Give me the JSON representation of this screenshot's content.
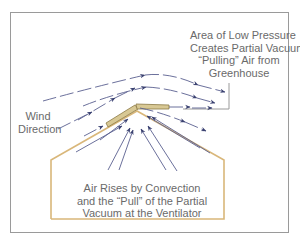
{
  "diagram": {
    "labels": {
      "low_pressure": [
        "Area of Low Pressure",
        "Creates Partial Vacuum;",
        "“Pulling” Air from",
        "Greenhouse"
      ],
      "wind_direction": [
        "Wind",
        "Direction"
      ],
      "convection": [
        "Air Rises by Convection",
        "and the “Pull” of the Partial",
        "Vacuum at the Ventilator"
      ]
    },
    "colors": {
      "frame": "#9a9a9a",
      "greenhouse_outline": "#d9b77a",
      "ventilator_fill": "#d8c894",
      "ventilator_stroke": "#8c7a45",
      "arrow": "#3a4170",
      "arrow_line": "#8a90b8",
      "text": "#6a6a6a"
    },
    "nodes": [
      {
        "id": "greenhouse",
        "type": "shape",
        "label": "Greenhouse outline"
      },
      {
        "id": "ventilator",
        "type": "shape",
        "label": "Ridge ventilator"
      },
      {
        "id": "wind",
        "type": "flow",
        "label": "Wind Direction"
      },
      {
        "id": "low_pressure_area",
        "type": "region",
        "label": "Area of Low Pressure"
      },
      {
        "id": "convection",
        "type": "flow",
        "label": "Air Rises by Convection"
      }
    ],
    "edges": [
      {
        "from": "wind",
        "to": "ventilator",
        "label": "wind flows over roof"
      },
      {
        "from": "convection",
        "to": "ventilator",
        "label": "air rises to vent"
      },
      {
        "from": "ventilator",
        "to": "low_pressure_area",
        "label": "air pulled out"
      }
    ]
  }
}
